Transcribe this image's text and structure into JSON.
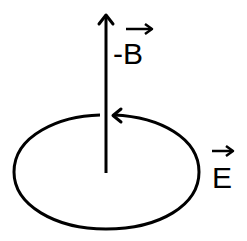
{
  "diagram": {
    "labels": {
      "b_field": "-B",
      "e_field": "E"
    },
    "colors": {
      "stroke": "#000000",
      "background": "#ffffff"
    }
  }
}
